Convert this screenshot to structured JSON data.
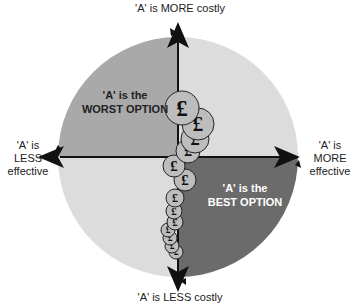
{
  "labels": {
    "top": "'A' is MORE costly",
    "bottom": "'A' is LESS costly",
    "left_line1": "'A' is",
    "left_line2": "LESS",
    "left_line3": "effective",
    "right_line1": "'A' is",
    "right_line2": "MORE",
    "right_line3": "effective"
  },
  "quadrants": {
    "worst_line1": "'A' is the",
    "worst_line2": "WORST OPTION",
    "best_line1": "'A' is the",
    "best_line2": "BEST OPTION"
  },
  "colors": {
    "neutral_quadrant": "#dcdcdc",
    "worst_quadrant": "#a9a9a9",
    "best_quadrant": "#6b6b6b",
    "coin_fill": "#bdbdbd",
    "axis": "#111111"
  },
  "coins": {
    "symbol": "£",
    "icon": "pound-coin-icon",
    "count": 11
  }
}
